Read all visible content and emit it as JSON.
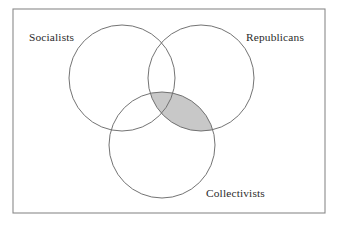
{
  "figure": {
    "type": "venn-diagram",
    "width": 342,
    "height": 229,
    "background_color": "#ffffff",
    "frame": {
      "x": 13,
      "y": 9,
      "width": 312,
      "height": 204,
      "stroke_color": "#8a8a8a",
      "fill_color": "#ffffff"
    }
  },
  "chart_data": {
    "type": "venn",
    "title": "",
    "set_count": 3,
    "sets": [
      {
        "id": "socialists",
        "label": "Socialists",
        "cx": 122,
        "cy": 78,
        "r": 53,
        "stroke_color": "#6b6b6b",
        "fill_color": "none",
        "label_x": 29,
        "label_y": 41,
        "label_anchor": "start"
      },
      {
        "id": "republicans",
        "label": "Republicans",
        "cx": 201,
        "cy": 78,
        "r": 53,
        "stroke_color": "#6b6b6b",
        "fill_color": "none",
        "label_x": 246,
        "label_y": 41,
        "label_anchor": "start"
      },
      {
        "id": "collectivists",
        "label": "Collectivists",
        "cx": 162,
        "cy": 145,
        "r": 53,
        "stroke_color": "#6b6b6b",
        "fill_color": "none",
        "label_x": 206,
        "label_y": 197,
        "label_anchor": "start"
      }
    ],
    "shaded_regions": [
      {
        "id": "republicans-and-collectivists",
        "description": "Intersection of Republicans and Collectivists",
        "members": [
          "republicans",
          "collectivists"
        ],
        "fill_color": "#c8c8c8"
      }
    ],
    "legend": null,
    "grid": false
  }
}
